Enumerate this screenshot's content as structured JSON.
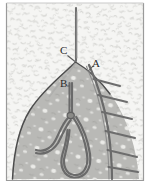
{
  "figure": {
    "width": 152,
    "height": 192,
    "frame": {
      "visible": true,
      "color": "#9a9a9a"
    },
    "background": {
      "name": "stippled-matrix-background",
      "fill": "#f4f4f2",
      "speckle_color": "#d8d8d6",
      "description": "light grey field covered in short irregular squiggle marks"
    },
    "body": {
      "name": "pointed-organ-body",
      "fill": "#b8b8b5",
      "outline": "#4a4a4a",
      "spot_color": "#f0f0ee",
      "description": "pointed dome / leaf-shaped region with pale internal spots"
    },
    "structures": {
      "stem": {
        "name": "apical-stem",
        "color": "#6f6f6f"
      },
      "loop": {
        "name": "internal-loop-tube",
        "color": "#6a6a6a"
      },
      "comb": {
        "name": "radiating-comb-branches",
        "color": "#6a6a6a",
        "branch_count": 6
      }
    },
    "labels": [
      {
        "id": "C",
        "text": "C",
        "x": 60,
        "y": 45,
        "target": "apex-stem-junction"
      },
      {
        "id": "A",
        "text": "A",
        "x": 92,
        "y": 58,
        "target": "upper-right-arc"
      },
      {
        "id": "B",
        "text": "B",
        "x": 60,
        "y": 78,
        "target": "central-vertical-duct"
      }
    ]
  }
}
